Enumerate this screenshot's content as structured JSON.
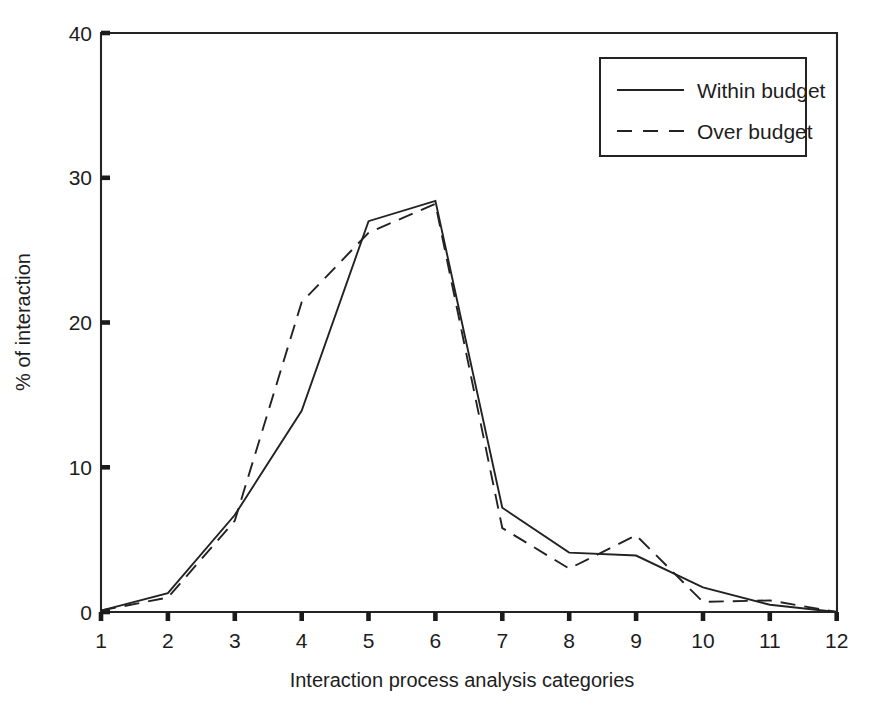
{
  "chart_data": {
    "type": "line",
    "title": "",
    "subtitle": "",
    "xlabel": "Interaction process analysis categories",
    "ylabel": "% of interaction",
    "x": [
      1,
      2,
      3,
      4,
      5,
      6,
      7,
      8,
      9,
      10,
      11,
      12
    ],
    "categories": [
      "1",
      "2",
      "3",
      "4",
      "5",
      "6",
      "7",
      "8",
      "9",
      "10",
      "11",
      "12"
    ],
    "xtick_labels": [
      "1",
      "2",
      "3",
      "4",
      "5",
      "6",
      "7",
      "8",
      "9",
      "10",
      "11",
      "12"
    ],
    "ytick_labels": [
      "0",
      "10",
      "20",
      "30",
      "40"
    ],
    "yticks": [
      0,
      10,
      20,
      30,
      40
    ],
    "xlim": [
      1,
      12
    ],
    "ylim": [
      0,
      40
    ],
    "grid": false,
    "legend_position": "top-right",
    "series": [
      {
        "name": "Within budget",
        "style": "solid",
        "color": "#222222",
        "values": [
          0.1,
          1.3,
          6.7,
          13.9,
          27.0,
          28.4,
          7.2,
          4.1,
          3.9,
          1.7,
          0.5,
          0.0
        ]
      },
      {
        "name": "Over budget",
        "style": "dashed",
        "color": "#222222",
        "values": [
          0.1,
          1.0,
          6.3,
          21.4,
          26.2,
          28.2,
          5.8,
          3.0,
          5.3,
          0.7,
          0.8,
          0.0
        ]
      }
    ]
  },
  "legend": {
    "entries": [
      {
        "label": "Within budget",
        "style": "solid"
      },
      {
        "label": "Over budget",
        "style": "dashed"
      }
    ]
  },
  "axes": {
    "x_title": "Interaction process analysis categories",
    "y_title": "% of interaction"
  }
}
